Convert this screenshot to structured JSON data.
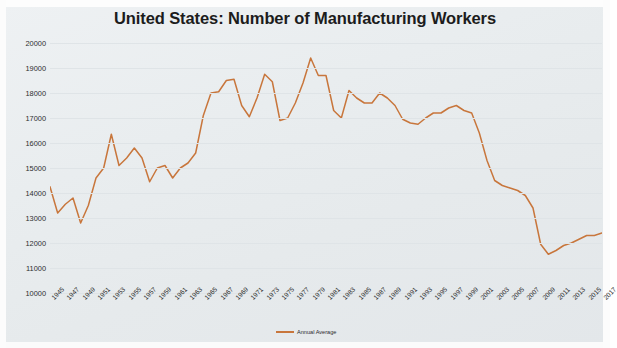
{
  "title": "United States: Number of Manufacturing Workers",
  "legend": {
    "label": "Annual Average"
  },
  "axes": {
    "ylabel": "Thousands",
    "yticks": [
      "20000",
      "19000",
      "18000",
      "17000",
      "16000",
      "15000",
      "14000",
      "13000",
      "12000",
      "11000",
      "10000"
    ],
    "xticks": [
      "1945",
      "1947",
      "1949",
      "1951",
      "1953",
      "1955",
      "1957",
      "1959",
      "1961",
      "1963",
      "1965",
      "1967",
      "1969",
      "1971",
      "1973",
      "1975",
      "1977",
      "1979",
      "1981",
      "1983",
      "1985",
      "1987",
      "1989",
      "1991",
      "1993",
      "1995",
      "1997",
      "1999",
      "2001",
      "2003",
      "2005",
      "2007",
      "2009",
      "2011",
      "2013",
      "2015",
      "2017"
    ]
  },
  "colors": {
    "line": "#c8763c",
    "grid": "#dfe4e7",
    "background": "#e8ecee",
    "text": "#2b2b2b",
    "title": "#1c1c1c"
  },
  "chart_data": {
    "type": "line",
    "title": "United States: Number of Manufacturing Workers",
    "xlabel": "",
    "ylabel": "Thousands",
    "ylim": [
      10000,
      20000
    ],
    "xlim": [
      1945,
      2017
    ],
    "grid": true,
    "legend_position": "bottom",
    "x": [
      1945,
      1946,
      1947,
      1948,
      1949,
      1950,
      1951,
      1952,
      1953,
      1954,
      1955,
      1956,
      1957,
      1958,
      1959,
      1960,
      1961,
      1962,
      1963,
      1964,
      1965,
      1966,
      1967,
      1968,
      1969,
      1970,
      1971,
      1972,
      1973,
      1974,
      1975,
      1976,
      1977,
      1978,
      1979,
      1980,
      1981,
      1982,
      1983,
      1984,
      1985,
      1986,
      1987,
      1988,
      1989,
      1990,
      1991,
      1992,
      1993,
      1994,
      1995,
      1996,
      1997,
      1998,
      1999,
      2000,
      2001,
      2002,
      2003,
      2004,
      2005,
      2006,
      2007,
      2008,
      2009,
      2010,
      2011,
      2012,
      2013,
      2014,
      2015,
      2016,
      2017
    ],
    "series": [
      {
        "name": "Annual Average",
        "color": "#c8763c",
        "values": [
          14250,
          13200,
          13550,
          13800,
          12800,
          13500,
          14600,
          15000,
          16350,
          15100,
          15400,
          15800,
          15400,
          14450,
          15000,
          15100,
          14600,
          15000,
          15200,
          15600,
          17100,
          18000,
          18050,
          18500,
          18550,
          17500,
          17050,
          17800,
          18750,
          18450,
          16900,
          17000,
          17600,
          18400,
          19400,
          18700,
          18700,
          17300,
          17000,
          18100,
          17800,
          17600,
          17600,
          18000,
          17800,
          17500,
          16950,
          16800,
          16750,
          17000,
          17200,
          17200,
          17400,
          17500,
          17300,
          17200,
          16400,
          15300,
          14500,
          14300,
          14200,
          14100,
          13900,
          13400,
          11950,
          11550,
          11700,
          11900,
          12000,
          12150,
          12300,
          12300,
          12400
        ]
      }
    ]
  }
}
